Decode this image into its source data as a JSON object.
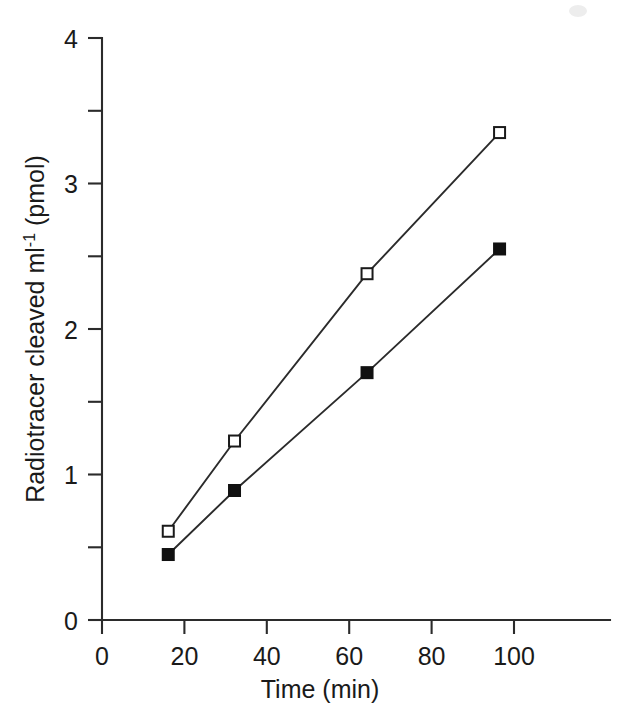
{
  "figure": {
    "background_color": "#ffffff",
    "ink_color": "#1a1a1a"
  },
  "chart_data": {
    "type": "line",
    "title": "",
    "xlabel": "Time (min)",
    "ylabel": "Radiotracer cleaved ml⁻¹ (pmol)",
    "ylabel_parts": {
      "main": "Radiotracer cleaved ml",
      "superscript": "-1",
      "units": " (pmol)"
    },
    "xlim": [
      0,
      115
    ],
    "ylim": [
      0,
      4
    ],
    "xticks": [
      0,
      20,
      40,
      60,
      80,
      100
    ],
    "xticklabels": [
      "0",
      "20",
      "40",
      "60",
      "80",
      "100"
    ],
    "yticks": [
      0,
      1,
      2,
      3,
      4
    ],
    "yticklabels": [
      "0",
      "1",
      "2",
      "3",
      "4"
    ],
    "yticks_minor": [
      0.5,
      1.5,
      2.5,
      3.5
    ],
    "grid": false,
    "legend": "none",
    "x": [
      15,
      30,
      60,
      90
    ],
    "series": [
      {
        "name": "open-squares",
        "marker": "open-square",
        "marker_fill": "#ffffff",
        "marker_edge": "#1a1a1a",
        "line_color": "#2b2b2b",
        "values": [
          0.61,
          1.23,
          2.38,
          3.35
        ]
      },
      {
        "name": "filled-squares",
        "marker": "filled-square",
        "marker_fill": "#111111",
        "marker_edge": "#111111",
        "line_color": "#2b2b2b",
        "values": [
          0.45,
          0.89,
          1.7,
          2.55
        ]
      }
    ]
  }
}
